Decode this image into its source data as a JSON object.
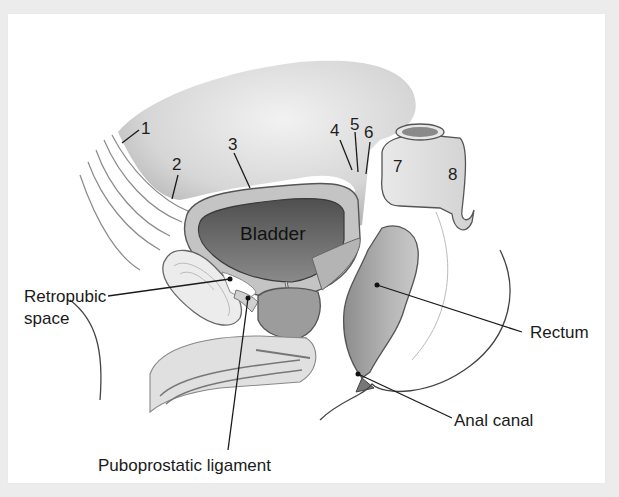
{
  "figure": {
    "organ_labels": {
      "bladder": "Bladder"
    },
    "numbered_labels": [
      {
        "id": "1",
        "text": "1"
      },
      {
        "id": "2",
        "text": "2"
      },
      {
        "id": "3",
        "text": "3"
      },
      {
        "id": "4",
        "text": "4"
      },
      {
        "id": "5",
        "text": "5"
      },
      {
        "id": "6",
        "text": "6"
      },
      {
        "id": "7",
        "text": "7"
      },
      {
        "id": "8",
        "text": "8"
      }
    ],
    "callouts": {
      "retropubic_line1": "Retropubic",
      "retropubic_line2": "space",
      "puboprostatic": "Puboprostatic ligament",
      "rectum": "Rectum",
      "anal_canal": "Anal canal"
    }
  },
  "colors": {
    "frame": "#ececec",
    "panel": "#ffffff",
    "peritoneum_fill": "#d9d9d9",
    "bladder_wall": "#bdbdbd",
    "bladder_lumen": "#6e6e6e",
    "prostate": "#9a9a9a",
    "rectum": "#a9a9a9",
    "outline": "#555555"
  }
}
